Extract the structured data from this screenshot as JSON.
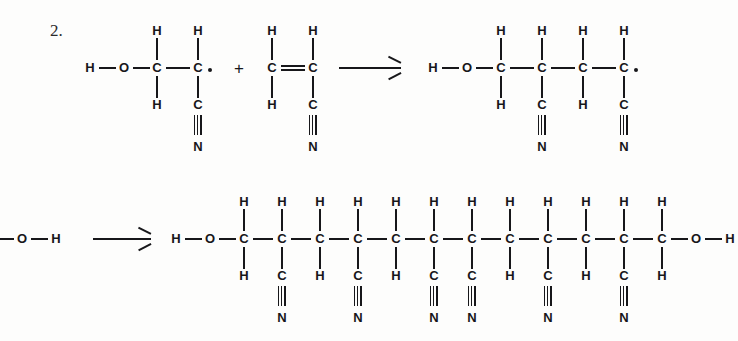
{
  "figure": {
    "step_label": "2.",
    "background_color": "#fdfdfc",
    "ink_color": "#17171a"
  },
  "glyphs": {
    "H": "H",
    "O": "O",
    "C": "C",
    "N": "N",
    "plus": "+",
    "arrow": "⟶",
    "radical_dot": "•",
    "triple_bond": "≡",
    "double_bond": "="
  },
  "rows": [
    {
      "name": "reaction-row-top",
      "reactant_1": {
        "name": "hydroxyethyl-nitrile-radical",
        "formula_atoms": [
          "H",
          "O",
          "C",
          "C"
        ],
        "backbone": [
          {
            "atom": "C",
            "top": "H",
            "bottom": "H"
          },
          {
            "atom": "C",
            "top": "H",
            "bottom": "C",
            "bottom_2": "N",
            "radical": true
          }
        ],
        "left_cap": [
          "H",
          "O"
        ]
      },
      "operator": "+",
      "reactant_2": {
        "name": "acrylonitrile-monomer",
        "backbone": [
          {
            "atom": "C",
            "top": "H",
            "bottom": "H"
          },
          {
            "atom": "C",
            "top": "H",
            "bottom": "C",
            "bottom_2": "N"
          }
        ],
        "bond_between": "double"
      },
      "arrow": "⟶",
      "product": {
        "name": "four-carbon-radical-adduct",
        "left_cap": [
          "H",
          "O"
        ],
        "backbone": [
          {
            "atom": "C",
            "top": "H",
            "bottom": "H"
          },
          {
            "atom": "C",
            "top": "H",
            "bottom": "C",
            "bottom_2": "N"
          },
          {
            "atom": "C",
            "top": "H",
            "bottom": "H"
          },
          {
            "atom": "C",
            "top": "H",
            "bottom": "C",
            "bottom_2": "N",
            "radical": true
          }
        ]
      }
    },
    {
      "name": "reaction-row-bottom",
      "reactant_fragment": {
        "name": "hydroxyl-fragment-clipped",
        "atoms": [
          "O",
          "H"
        ],
        "clipped_left": true
      },
      "arrow": "⟶",
      "product": {
        "name": "polyacrylonitrile-chain",
        "left_cap": [
          "H",
          "O"
        ],
        "right_cap": [
          "O",
          "H"
        ],
        "carbon_count": 12,
        "backbone": [
          {
            "atom": "C",
            "top": "H",
            "bottom": "H"
          },
          {
            "atom": "C",
            "top": "H",
            "bottom": "C",
            "bottom_2": "N"
          },
          {
            "atom": "C",
            "top": "H",
            "bottom": "H"
          },
          {
            "atom": "C",
            "top": "H",
            "bottom": "C",
            "bottom_2": "N"
          },
          {
            "atom": "C",
            "top": "H",
            "bottom": "H"
          },
          {
            "atom": "C",
            "top": "H",
            "bottom": "C",
            "bottom_2": "N"
          },
          {
            "atom": "C",
            "top": "H",
            "bottom": "C",
            "bottom_2": "N"
          },
          {
            "atom": "C",
            "top": "H",
            "bottom": "H"
          },
          {
            "atom": "C",
            "top": "H",
            "bottom": "C",
            "bottom_2": "N"
          },
          {
            "atom": "C",
            "top": "H",
            "bottom": "H"
          },
          {
            "atom": "C",
            "top": "H",
            "bottom": "C",
            "bottom_2": "N"
          },
          {
            "atom": "C",
            "top": "H",
            "bottom": "H"
          }
        ]
      }
    }
  ]
}
